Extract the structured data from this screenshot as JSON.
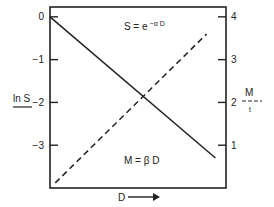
{
  "chart_data": {
    "type": "line",
    "title": "",
    "xlabel": "D",
    "x_arrow": true,
    "x_ticks": [],
    "xlim": [
      0,
      1
    ],
    "y_left": {
      "label": "ln S",
      "ylim": [
        -4.0,
        0.23
      ],
      "ticks": [
        0,
        -1,
        -2,
        -3
      ],
      "tick_labels": [
        "0",
        "−1",
        "−2",
        "−3"
      ]
    },
    "y_right": {
      "label": "M",
      "label_sub": "t",
      "ylim": [
        0,
        4.23
      ],
      "ticks": [
        4,
        3,
        2,
        1
      ],
      "tick_labels": [
        "4",
        "3",
        "2",
        "1"
      ]
    },
    "grid": false,
    "series": [
      {
        "name": "ln S",
        "axis": "left",
        "style": "solid",
        "color": "#222222",
        "x": [
          0.0,
          0.94
        ],
        "y": [
          0.0,
          -3.3
        ],
        "annotation": {
          "text": "S = e",
          "sup": "−α D",
          "x": 0.42,
          "y": -0.3
        }
      },
      {
        "name": "M",
        "axis": "right",
        "style": "dashed",
        "color": "#222222",
        "x": [
          0.03,
          0.89
        ],
        "y": [
          0.12,
          3.6
        ],
        "annotation": {
          "text": "M = β D",
          "x": 0.42,
          "y": 0.55
        }
      }
    ]
  }
}
